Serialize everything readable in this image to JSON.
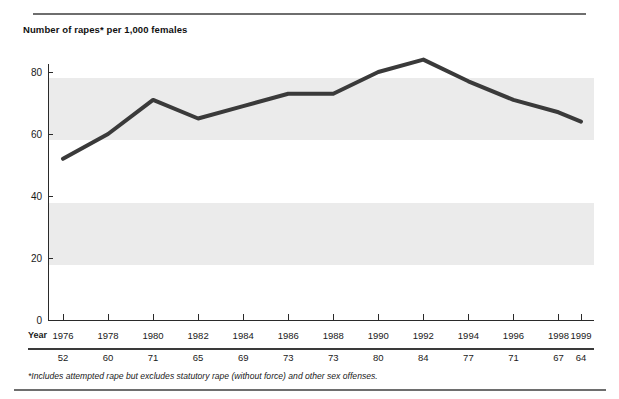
{
  "page": {
    "clipped_header_text": "",
    "footnote": "*Includes attempted rape but excludes statutory rape (without force) and other sex offenses.",
    "year_row_label": "Year"
  },
  "chart_data": {
    "type": "line",
    "title": "Number of rapes* per 1,000 females",
    "xlabel": "Year",
    "ylabel": "",
    "categories": [
      "1976",
      "1978",
      "1980",
      "1982",
      "1984",
      "1986",
      "1988",
      "1990",
      "1992",
      "1994",
      "1996",
      "1998",
      "1999"
    ],
    "x": [
      1976,
      1978,
      1980,
      1982,
      1984,
      1986,
      1988,
      1990,
      1992,
      1994,
      1996,
      1998,
      1999
    ],
    "values": [
      52,
      60,
      71,
      65,
      69,
      73,
      73,
      80,
      84,
      77,
      71,
      67,
      64
    ],
    "series": [
      {
        "name": "Number of rapes per 1,000 females",
        "values": [
          52,
          60,
          71,
          65,
          69,
          73,
          73,
          80,
          84,
          77,
          71,
          67,
          64
        ]
      }
    ],
    "ylim": [
      0,
      88
    ],
    "yticks": [
      0,
      20,
      40,
      60,
      80
    ],
    "ytick_labels": [
      "0",
      "20",
      "40",
      "60",
      "80"
    ],
    "xlim": [
      1976,
      1999
    ],
    "grid": false,
    "legend": "none",
    "banded_regions": [
      {
        "from": 60,
        "to": 80,
        "color": "#ebebeb"
      },
      {
        "from": 20,
        "to": 40,
        "color": "#ebebeb"
      }
    ],
    "line_color": "#3a3a3a",
    "line_width": 4
  }
}
